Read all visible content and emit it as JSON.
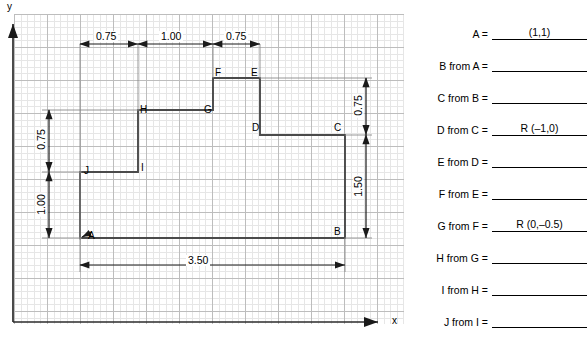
{
  "figure": {
    "axes": {
      "y_label": "y",
      "x_label": "x"
    },
    "vertices": [
      {
        "name": "A",
        "label": "A"
      },
      {
        "name": "B",
        "label": "B"
      },
      {
        "name": "C",
        "label": "C"
      },
      {
        "name": "D",
        "label": "D"
      },
      {
        "name": "E",
        "label": "E"
      },
      {
        "name": "F",
        "label": "F"
      },
      {
        "name": "G",
        "label": "G"
      },
      {
        "name": "H",
        "label": "H"
      },
      {
        "name": "I",
        "label": "I"
      },
      {
        "name": "J",
        "label": "J"
      }
    ],
    "dimensions": {
      "top_left": "0.75",
      "top_middle": "1.00",
      "top_right": "0.75",
      "left_upper": "0.75",
      "left_lower": "1.00",
      "right_upper": "0.75",
      "right_lower": "1.50",
      "bottom": "3.50"
    }
  },
  "answers": {
    "rows": [
      {
        "label": "A  =",
        "value": "(1,1)"
      },
      {
        "label": "B from A  =",
        "value": ""
      },
      {
        "label": "C from B  =",
        "value": ""
      },
      {
        "label": "D from C  =",
        "value": "R (–1,0)"
      },
      {
        "label": "E from D  =",
        "value": ""
      },
      {
        "label": "F from E  =",
        "value": ""
      },
      {
        "label": "G from F  =",
        "value": "R (0,–0.5)"
      },
      {
        "label": "H from G  =",
        "value": ""
      },
      {
        "label": "I from H  =",
        "value": ""
      },
      {
        "label": "J from I  =",
        "value": ""
      }
    ]
  }
}
